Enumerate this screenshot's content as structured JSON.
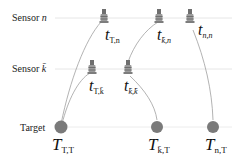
{
  "rows": {
    "sensor_n": {
      "label": "Sensor ",
      "var": "n"
    },
    "sensor_k": {
      "label": "Sensor ",
      "var": "k̄"
    },
    "target": {
      "label": "Target"
    }
  },
  "timestamps": [
    {
      "id": "t-T-n",
      "sym": "t",
      "sub": "T,n"
    },
    {
      "id": "t-k-n",
      "sym": "t",
      "sub": "k̄,n"
    },
    {
      "id": "t-n-n",
      "sym": "t",
      "sub": "n,n"
    },
    {
      "id": "t-T-k",
      "sym": "t",
      "sub": "T,k̄"
    },
    {
      "id": "t-k-k",
      "sym": "t",
      "sub": "k̄,k̄"
    },
    {
      "id": "T-T-T",
      "sym": "T",
      "sub": "T,T"
    },
    {
      "id": "T-k-T",
      "sym": "T",
      "sub": "k̄,T"
    },
    {
      "id": "T-n-T",
      "sym": "T",
      "sub": "n,T"
    }
  ],
  "colors": {
    "row_line": "#e2e2e2",
    "curve": "#9a9a9a",
    "target_dot": "#7a7a7a",
    "sensor_icon": "#8c8c8c"
  }
}
